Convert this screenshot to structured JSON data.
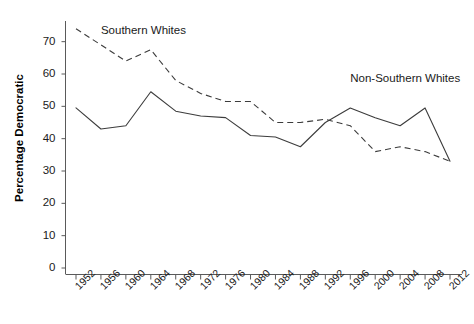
{
  "chart_data": {
    "type": "line",
    "title": "",
    "xlabel": "",
    "ylabel": "Percentage Democratic",
    "x": [
      1952,
      1956,
      1960,
      1964,
      1968,
      1972,
      1976,
      1980,
      1984,
      1988,
      1992,
      1996,
      2000,
      2004,
      2008,
      2012
    ],
    "categories": [
      "1952",
      "1956",
      "1960",
      "1964",
      "1968",
      "1972",
      "1976",
      "1980",
      "1984",
      "1988",
      "1992",
      "1996",
      "2000",
      "2004",
      "2008",
      "2012"
    ],
    "xlim": [
      1952,
      2012
    ],
    "ylim": [
      0,
      75
    ],
    "yticks": [
      0,
      10,
      20,
      30,
      40,
      50,
      60,
      70
    ],
    "ytick_labels": [
      "0",
      "10",
      "20",
      "30",
      "40",
      "50",
      "60",
      "70"
    ],
    "grid": false,
    "legend_position": "inline-annotations",
    "series": [
      {
        "name": "Southern Whites",
        "style": "dashed",
        "color": "#3c3c3c",
        "values": [
          74,
          69,
          64,
          67.5,
          58,
          54,
          51.5,
          51.5,
          45,
          45,
          46,
          44,
          36,
          37.5,
          36,
          33
        ]
      },
      {
        "name": "Non-Southern Whites",
        "style": "solid",
        "color": "#3c3c3c",
        "values": [
          49.5,
          43,
          44,
          54.5,
          48.5,
          47,
          46.5,
          41,
          40.5,
          37.5,
          45,
          49.5,
          46.5,
          44,
          49.5,
          33
        ]
      }
    ],
    "annotations": [
      {
        "text": "Southern Whites",
        "x": 1956,
        "y": 73
      },
      {
        "text": "Non-Southern Whites",
        "x": 1996,
        "y": 58
      }
    ]
  }
}
